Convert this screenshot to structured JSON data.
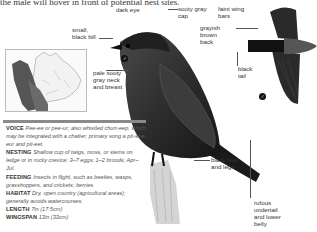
{
  "intro_text": "the male will hover in front of potential nest sites.",
  "labels": {
    "dark_eye": "dark eye",
    "small_black_bill": "small, black bill",
    "sooty_gray_cap": "sooty gray cap",
    "grayish_brown_back": "grayish brown back",
    "faint_wing_bars": "faint wing bars",
    "black_tail": "black tail",
    "pale_neck_breast": "pale sooty gray neck and breast",
    "black_feet_legs": "black feet and legs",
    "rufous_undertail": "rufous undertail and lower belly"
  },
  "symbols": {
    "perched": "male-female-symbol",
    "flight": "male-female-symbol"
  },
  "map": {
    "description": "range map of Canada",
    "range_color": "#555555"
  },
  "facts": [
    {
      "key": "VOICE",
      "value": "Pee-ee or pee-ur; also whistled churr-eep, which may be integrated with a chatter; primary song a pit-see-eur and pit-eet."
    },
    {
      "key": "NESTING",
      "value": "Shallow cup of twigs, moss, or stems on ledge or in rocky crevice; 3–7 eggs; 1–2 broods; Apr–Jul."
    },
    {
      "key": "FEEDING",
      "value": "Insects in flight, such as beetles, wasps, grasshoppers, and crickets; berries."
    },
    {
      "key": "HABITAT",
      "value": "Dry, open country (agricultural areas); generally avoids watercourses."
    },
    {
      "key": "LENGTH",
      "value": "7in (17.5cm)"
    },
    {
      "key": "WINGSPAN",
      "value": "13in (33cm)"
    }
  ]
}
